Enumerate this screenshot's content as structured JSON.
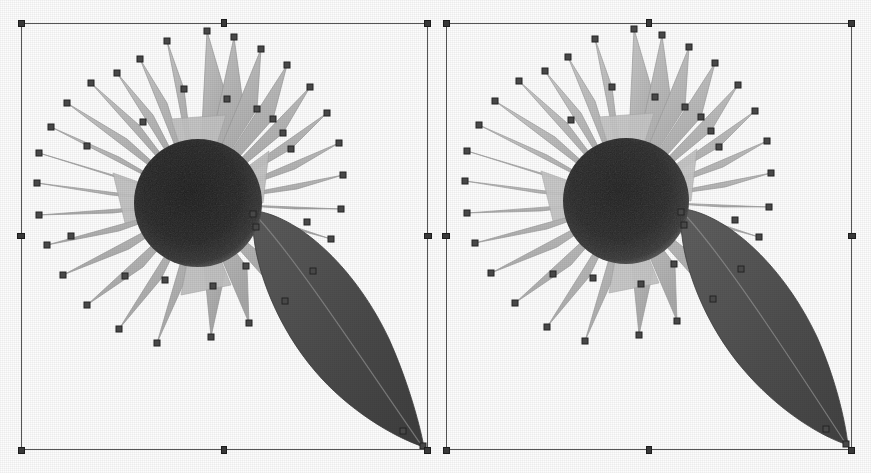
{
  "app": {
    "kind": "vector-graphics-editor",
    "view_mode": "side-by-side-comparison",
    "background_color": "#fdfdfd",
    "selection_color": "#555555",
    "handle_color": "#3a3a3a",
    "anchor_color": "#4a4a4a"
  },
  "panels": [
    {
      "id": "left",
      "name": "left-artboard",
      "label": "",
      "selection": {
        "x": 21,
        "y": 23,
        "width": 407,
        "height": 427,
        "handles": [
          {
            "name": "handle-top-left",
            "position": "top-left"
          },
          {
            "name": "handle-top-center",
            "position": "top-center"
          },
          {
            "name": "handle-top-right",
            "position": "top-right"
          },
          {
            "name": "handle-middle-left",
            "position": "middle-left"
          },
          {
            "name": "handle-middle-right",
            "position": "middle-right"
          },
          {
            "name": "handle-bottom-left",
            "position": "bottom-left"
          },
          {
            "name": "handle-bottom-center",
            "position": "bottom-center"
          },
          {
            "name": "handle-bottom-right",
            "position": "bottom-right"
          }
        ]
      },
      "artwork": {
        "subject": "sunflower",
        "disc_color": "#262626",
        "petal_color": "#b9b9b9",
        "petal_outline": "#9a9a9a",
        "leaf_color": "#4c4c4c",
        "petal_count": 26,
        "anchor_point_count": 46,
        "disc": {
          "cx": 198,
          "cy": 202,
          "r": 63
        },
        "leaf": {
          "tip_x": 424,
          "tip_y": 446
        }
      }
    },
    {
      "id": "right",
      "name": "right-artboard",
      "label": "",
      "selection": {
        "x": 446,
        "y": 23,
        "width": 406,
        "height": 427,
        "handles": [
          {
            "name": "handle-top-left",
            "position": "top-left"
          },
          {
            "name": "handle-top-center",
            "position": "top-center"
          },
          {
            "name": "handle-top-right",
            "position": "top-right"
          },
          {
            "name": "handle-middle-left",
            "position": "middle-left"
          },
          {
            "name": "handle-middle-right",
            "position": "middle-right"
          },
          {
            "name": "handle-bottom-left",
            "position": "bottom-left"
          },
          {
            "name": "handle-bottom-center",
            "position": "bottom-center"
          },
          {
            "name": "handle-bottom-right",
            "position": "bottom-right"
          }
        ]
      },
      "artwork": {
        "subject": "sunflower",
        "disc_color": "#2a2a2a",
        "petal_color": "#bdbdbd",
        "petal_outline": "#9e9e9e",
        "leaf_color": "#505050",
        "petal_count": 26,
        "anchor_point_count": 44,
        "disc": {
          "cx": 626,
          "cy": 200,
          "r": 62
        },
        "leaf": {
          "tip_x": 845,
          "tip_y": 444
        }
      }
    }
  ]
}
